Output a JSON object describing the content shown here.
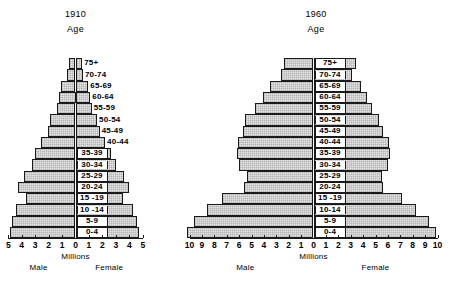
{
  "figure": {
    "axis_caption": "Millions",
    "left_sex_label": "Male",
    "right_sex_label": "Female",
    "age_axis_label": "Age",
    "bar_fill_color": "#e3e3e3",
    "bar_stroke_color": "#1a1a1a",
    "background_color": "#ffffff"
  },
  "chart_data": [
    {
      "type": "bar",
      "title": "1910",
      "subtitle": "Age",
      "xlabel": "Millions",
      "ylabel": "Age",
      "orientation": "population-pyramid",
      "grid": false,
      "legend_position": "none",
      "xlim": [
        -5,
        5
      ],
      "xticks": [
        "5",
        "4",
        "3",
        "2",
        "1",
        "0",
        "1",
        "2",
        "3",
        "4",
        "5"
      ],
      "xtick_values": [
        -5,
        -4,
        -3,
        -2,
        -1,
        0,
        1,
        2,
        3,
        4,
        5
      ],
      "categories": [
        "0-4",
        "5-9",
        "10 -14",
        "15 -19",
        "20-24",
        "25-29",
        "30-34",
        "35-39",
        "40-44",
        "45-49",
        "50-54",
        "55-59",
        "60-64",
        "65-69",
        "70-74",
        "75+"
      ],
      "series": [
        {
          "name": "Male",
          "side": "left",
          "values": [
            4.85,
            4.75,
            4.45,
            3.65,
            4.25,
            3.85,
            3.25,
            3.0,
            2.6,
            2.05,
            1.9,
            1.35,
            1.25,
            1.1,
            0.6,
            0.5
          ]
        },
        {
          "name": "Female",
          "side": "right",
          "values": [
            4.7,
            4.6,
            4.3,
            3.5,
            3.95,
            3.6,
            3.0,
            2.65,
            2.2,
            1.8,
            1.6,
            1.2,
            1.1,
            0.95,
            0.55,
            0.5
          ]
        }
      ]
    },
    {
      "type": "bar",
      "title": "1960",
      "subtitle": "Age",
      "xlabel": "Millions",
      "ylabel": "Age",
      "orientation": "population-pyramid",
      "grid": false,
      "legend_position": "none",
      "xlim": [
        -10,
        10
      ],
      "xticks": [
        "10",
        "9",
        "8",
        "7",
        "6",
        "5",
        "4",
        "3",
        "2",
        "1",
        "0",
        "1",
        "2",
        "3",
        "4",
        "5",
        "6",
        "7",
        "8",
        "9",
        "10"
      ],
      "xtick_values": [
        -10,
        -9,
        -8,
        -7,
        -6,
        -5,
        -4,
        -3,
        -2,
        -1,
        0,
        1,
        2,
        3,
        4,
        5,
        6,
        7,
        8,
        9,
        10
      ],
      "categories": [
        "0-4",
        "5-9",
        "10-14",
        "15 -19",
        "20-24",
        "25-29",
        "30-34",
        "35-39",
        "40-44",
        "45-49",
        "50-54",
        "55-59",
        "60-64",
        "65-69",
        "70-74",
        "75+"
      ],
      "series": [
        {
          "name": "Male",
          "side": "left",
          "values": [
            10.2,
            9.6,
            8.6,
            7.4,
            5.6,
            5.4,
            6.0,
            6.2,
            6.1,
            5.7,
            5.5,
            4.7,
            4.1,
            3.5,
            2.6,
            2.4
          ]
        },
        {
          "name": "Female",
          "side": "right",
          "values": [
            9.9,
            9.3,
            8.3,
            7.1,
            5.6,
            5.5,
            6.0,
            6.2,
            6.1,
            5.6,
            5.3,
            4.7,
            4.3,
            3.8,
            3.1,
            3.4
          ]
        }
      ]
    }
  ]
}
